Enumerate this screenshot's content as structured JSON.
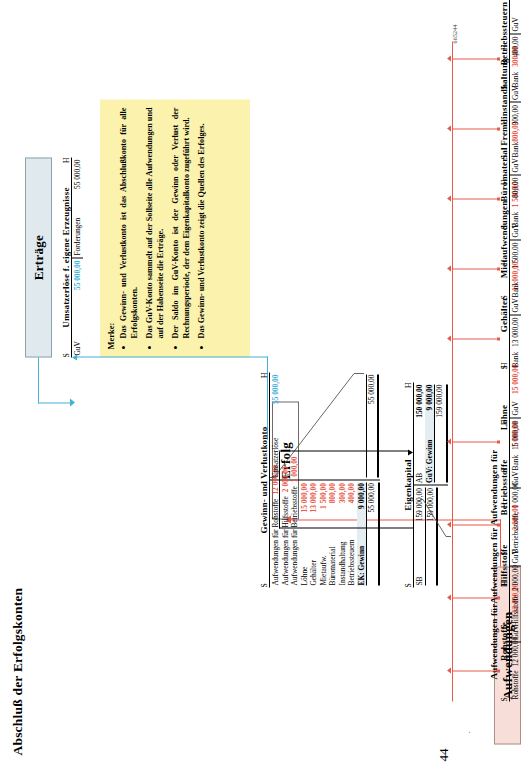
{
  "page": {
    "number": "44",
    "id": "665244",
    "title": "Abschluß der Erfolgskonten"
  },
  "banners": {
    "aufwendungen": "Aufwendungen",
    "erfolg": "Erfolg",
    "ertraege": "Erträge"
  },
  "merke": {
    "heading": "Merke:",
    "bullets": [
      "Das Gewinn- und Verlustkonto ist das Abschlußkonto für alle Erfolgskonten.",
      "Das GuV-Konto sammelt auf der Sollseite alle Aufwendungen und auf der Habenseite die Erträge.",
      "Der Saldo im GuV-Konto ist der Gewinn oder Verlust der Rechnungsperiode, der dem Eigenkapitalkonto zugeführt wird.",
      "Das Gewinn- und Verlustkonto zeigt die Quellen des Erfolges."
    ]
  },
  "expense_accounts": [
    {
      "title": "Aufwendungen für Rohstoffe",
      "s": "S",
      "h": "H",
      "debit": {
        "label": "Rohstoffe",
        "amount": "12 000,00"
      },
      "credit": {
        "label": "GuV",
        "amount": "12 000,00"
      }
    },
    {
      "title": "Aufwendungen für Hilfsstoffe",
      "s": "S",
      "h": "H",
      "debit": {
        "label": "Hilfsstoffe",
        "amount": "2 000,00"
      },
      "credit": {
        "label": "GuV",
        "amount": "2 000,00"
      }
    },
    {
      "title": "Aufwendungen für Betriebsstoffe",
      "s": "S",
      "h": "H",
      "debit": {
        "label": "Betriebsstoffe",
        "amount": "1 000,00"
      },
      "credit": {
        "label": "GuV",
        "amount": "1 000,00"
      }
    },
    {
      "title": "Löhne",
      "s": "S",
      "h": "H",
      "debit": {
        "label": "Bank",
        "amount": "15 000,00"
      },
      "credit": {
        "label": "GuV",
        "amount": "15 000,00"
      }
    },
    {
      "title": "Gehälter",
      "s": "S",
      "h": "H",
      "debit": {
        "label": "Bank",
        "amount": "13 000,00"
      },
      "credit": {
        "label": "GuV",
        "amount": "13 000,00"
      }
    },
    {
      "title": "Mietaufwendungen",
      "s": "S",
      "h": "H",
      "debit": {
        "label": "Bank",
        "amount": "1 500,00"
      },
      "credit": {
        "label": "GuV",
        "amount": "1 500,00"
      }
    },
    {
      "title": "Büromaterial",
      "s": "S",
      "h": "H",
      "debit": {
        "label": "Bank",
        "amount": "800,00"
      },
      "credit": {
        "label": "GuV",
        "amount": "800,00"
      }
    },
    {
      "title": "Fremdinstandhaltung",
      "s": "S",
      "h": "H",
      "debit": {
        "label": "Bank",
        "amount": "300,00"
      },
      "credit": {
        "label": "GuV",
        "amount": "300,00"
      }
    },
    {
      "title": "Betriebssteuern",
      "s": "S",
      "h": "H",
      "debit": {
        "label": "Bank",
        "amount": "400,00"
      },
      "credit": {
        "label": "GuV",
        "amount": "400,00"
      }
    }
  ],
  "guv": {
    "title": "Gewinn- und Verlustkonto",
    "s": "S",
    "h": "H",
    "debit_rows": [
      {
        "label": "Aufwendungen für Rohstoffe",
        "amount": "12 000,00"
      },
      {
        "label": "Aufwendungen für Hilfsstoffe",
        "amount": "2 000,00"
      },
      {
        "label": "Aufwendungen für Betriebsstoffe",
        "amount": "1 000,00"
      },
      {
        "label": "Löhne",
        "amount": "15 000,00"
      },
      {
        "label": "Gehälter",
        "amount": "13 000,00"
      },
      {
        "label": "Mietaufw.",
        "amount": "1 500,00"
      },
      {
        "label": "Büromaterial",
        "amount": "800,00"
      },
      {
        "label": "Instandhaltung",
        "amount": "300,00"
      },
      {
        "label": "Betriebssteuern",
        "amount": "400,00"
      }
    ],
    "debit_balance": {
      "label": "EK: Gewinn",
      "amount": "9 000,00"
    },
    "debit_total": "55 000,00",
    "credit_rows": [
      {
        "label": "Umsatzerlöse",
        "amount": "55 000,00"
      }
    ],
    "credit_total": "55 000,00"
  },
  "eigenkapital": {
    "title": "Eigenkapital",
    "s": "S",
    "h": "H",
    "debit_rows": [
      {
        "label": "SB",
        "amount": "159 000,00"
      }
    ],
    "debit_total": "159 000,00",
    "credit_rows": [
      {
        "label": "AB",
        "amount": "150 000,00"
      },
      {
        "label": "GuV: Gewinn",
        "amount": "9 000,00"
      }
    ],
    "credit_total": "159 000,00"
  },
  "revenue_account": {
    "title": "Umsatzerlöse f. eigene Erzeugnisse",
    "s": "S",
    "h": "H",
    "debit": {
      "label": "GuV",
      "amount": "55 000,00"
    },
    "credit": {
      "label": "Forderungen",
      "amount": "55 000,00"
    }
  },
  "colors": {
    "expense_accent": "#e8594a",
    "revenue_accent": "#43b2d8",
    "merke_bg": "#fbf2ad",
    "aufwendungen_bg": "#f8ded8",
    "ertraege_bg": "#dfe9ee"
  }
}
